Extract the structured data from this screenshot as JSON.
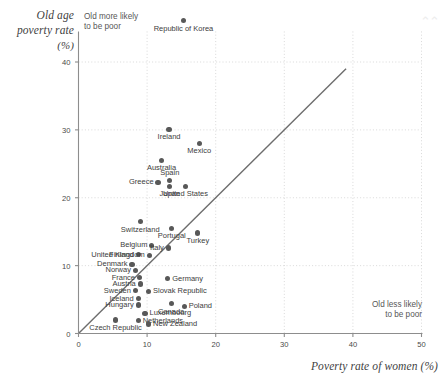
{
  "chart_data": {
    "type": "scatter",
    "title": "",
    "ylabel": "Old age poverty rate (%)",
    "xlabel": "Poverty rate of women (%)",
    "xlim": [
      0,
      50
    ],
    "ylim": [
      0,
      44
    ],
    "xticks": [
      0,
      10,
      20,
      30,
      40,
      50
    ],
    "yticks": [
      0,
      10,
      20,
      30,
      40
    ],
    "grid": true,
    "annotations": [
      {
        "id": "note-top-left",
        "line1": "Old more likely",
        "line2": "to be poor"
      },
      {
        "id": "note-bottom-right",
        "line1": "Old less likely",
        "line2": "to be poor"
      }
    ],
    "reference_line": {
      "type": "identity",
      "from": [
        0,
        0
      ],
      "to": [
        39,
        39
      ]
    },
    "points": [
      {
        "label": "Republic of Korea",
        "x": 15.3,
        "y": 46.1,
        "lp": "below-center"
      },
      {
        "label": "Ireland",
        "x": 13.2,
        "y": 30.1,
        "lp": "below-center"
      },
      {
        "label": "Mexico",
        "x": 17.6,
        "y": 28.0,
        "lp": "below-center"
      },
      {
        "label": "Australia",
        "x": 12.1,
        "y": 25.5,
        "lp": "below-center"
      },
      {
        "label": "Greece",
        "x": 11.6,
        "y": 22.3,
        "lp": "left"
      },
      {
        "label": "Spain",
        "x": 13.3,
        "y": 22.5,
        "lp": "above-center"
      },
      {
        "label": "Japan",
        "x": 13.3,
        "y": 21.7,
        "lp": "below-center"
      },
      {
        "label": "United States",
        "x": 15.6,
        "y": 21.7,
        "lp": "below-center"
      },
      {
        "label": "Switzerland",
        "x": 9.0,
        "y": 16.5,
        "lp": "below-center"
      },
      {
        "label": "Portugal",
        "x": 13.6,
        "y": 15.5,
        "lp": "below-center"
      },
      {
        "label": "Turkey",
        "x": 17.4,
        "y": 14.8,
        "lp": "below-center"
      },
      {
        "label": "Belgium",
        "x": 10.7,
        "y": 13.0,
        "lp": "left"
      },
      {
        "label": "Italy",
        "x": 13.1,
        "y": 12.6,
        "lp": "left"
      },
      {
        "label": "Finland",
        "x": 8.7,
        "y": 11.6,
        "lp": "left"
      },
      {
        "label": "United Kingdom",
        "x": 10.3,
        "y": 11.5,
        "lp": "left"
      },
      {
        "label": "Denmark",
        "x": 7.8,
        "y": 10.2,
        "lp": "left"
      },
      {
        "label": "Norway",
        "x": 8.3,
        "y": 9.3,
        "lp": "left"
      },
      {
        "label": "France",
        "x": 8.9,
        "y": 8.2,
        "lp": "left"
      },
      {
        "label": "Austria",
        "x": 9.0,
        "y": 7.3,
        "lp": "left"
      },
      {
        "label": "Germany",
        "x": 13.0,
        "y": 8.1,
        "lp": "right"
      },
      {
        "label": "Sweden",
        "x": 8.3,
        "y": 6.3,
        "lp": "left"
      },
      {
        "label": "Slovak Republic",
        "x": 10.2,
        "y": 6.2,
        "lp": "right"
      },
      {
        "label": "Iceland",
        "x": 8.7,
        "y": 5.1,
        "lp": "left"
      },
      {
        "label": "Hungary",
        "x": 8.7,
        "y": 4.2,
        "lp": "left"
      },
      {
        "label": "Canada",
        "x": 13.5,
        "y": 4.4,
        "lp": "below-center"
      },
      {
        "label": "Poland",
        "x": 15.4,
        "y": 4.0,
        "lp": "right"
      },
      {
        "label": "Luxembourg",
        "x": 9.7,
        "y": 3.0,
        "lp": "right"
      },
      {
        "label": "Netherlands",
        "x": 8.7,
        "y": 1.9,
        "lp": "right"
      },
      {
        "label": "Czech Republic",
        "x": 5.4,
        "y": 2.0,
        "lp": "below-center"
      },
      {
        "label": "New Zealand",
        "x": 10.2,
        "y": 1.4,
        "lp": "right"
      }
    ]
  },
  "decor": {
    "watermark": "⌃⌃"
  }
}
